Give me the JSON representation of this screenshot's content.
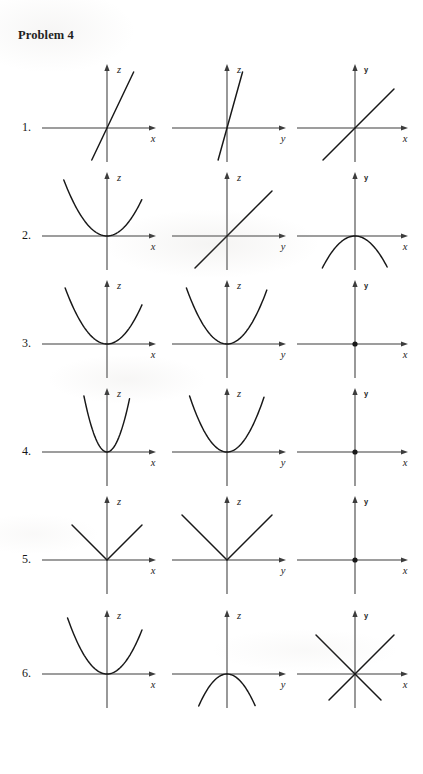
{
  "page": {
    "title": "Problem 4",
    "background_color": "#ffffff",
    "ink_color": "#181818",
    "axis_color": "#3c3c3c"
  },
  "layout": {
    "columns": [
      {
        "name": "trace-z-vs-x",
        "left": 40,
        "origin_x": 67,
        "width": 128
      },
      {
        "name": "trace-z-vs-y",
        "left": 170,
        "origin_x": 57,
        "width": 128
      },
      {
        "name": "trace-y-vs-x",
        "left": 295,
        "origin_x": 60,
        "width": 125
      }
    ],
    "row_tops": [
      10,
      118,
      226,
      334,
      442,
      556
    ],
    "axis_y_in_row": 70
  },
  "rows": [
    {
      "label": "1.",
      "cells": [
        {
          "name": "row1-col1",
          "shape": "line",
          "slope": 2.1,
          "hlabel": "x",
          "vlabel": "z",
          "vlabel_style": "serif-italic"
        },
        {
          "name": "row1-col2",
          "shape": "line",
          "slope": 3.6,
          "hlabel": "y",
          "vlabel": "z",
          "vlabel_style": "serif-italic"
        },
        {
          "name": "row1-col3",
          "shape": "line",
          "slope": 1.0,
          "hlabel": "x",
          "vlabel": "y",
          "vlabel_style": "sans-bold"
        }
      ]
    },
    {
      "label": "2.",
      "cells": [
        {
          "name": "row2-col1",
          "shape": "parabola-up",
          "a": 0.03,
          "hlabel": "x",
          "vlabel": "z",
          "vlabel_style": "serif-italic"
        },
        {
          "name": "row2-col2",
          "shape": "line",
          "slope": 1.0,
          "hlabel": "y",
          "vlabel": "z",
          "vlabel_style": "serif-italic"
        },
        {
          "name": "row2-col3",
          "shape": "parabola-down",
          "a": 0.03,
          "hlabel": "x",
          "vlabel": "y",
          "vlabel_style": "sans-bold"
        }
      ]
    },
    {
      "label": "3.",
      "cells": [
        {
          "name": "row3-col1",
          "shape": "parabola-up",
          "a": 0.032,
          "hlabel": "x",
          "vlabel": "z",
          "vlabel_style": "serif-italic"
        },
        {
          "name": "row3-col2",
          "shape": "parabola-up",
          "a": 0.034,
          "hlabel": "y",
          "vlabel": "z",
          "vlabel_style": "serif-italic"
        },
        {
          "name": "row3-col3",
          "shape": "point",
          "hlabel": "x",
          "vlabel": "y",
          "vlabel_style": "sans-bold"
        }
      ]
    },
    {
      "label": "4.",
      "cells": [
        {
          "name": "row4-col1",
          "shape": "parabola-up",
          "a": 0.105,
          "hlabel": "x",
          "vlabel": "z",
          "vlabel_style": "serif-italic"
        },
        {
          "name": "row4-col2",
          "shape": "parabola-up",
          "a": 0.04,
          "hlabel": "y",
          "vlabel": "z",
          "vlabel_style": "serif-italic"
        },
        {
          "name": "row4-col3",
          "shape": "point",
          "hlabel": "x",
          "vlabel": "y",
          "vlabel_style": "sans-bold"
        }
      ]
    },
    {
      "label": "5.",
      "cells": [
        {
          "name": "row5-col1",
          "shape": "vee",
          "slope": 1.0,
          "hlabel": "x",
          "vlabel": "z",
          "vlabel_style": "serif-italic"
        },
        {
          "name": "row5-col2",
          "shape": "vee",
          "slope": 1.0,
          "hlabel": "y",
          "vlabel": "z",
          "vlabel_style": "serif-italic"
        },
        {
          "name": "row5-col3",
          "shape": "point",
          "hlabel": "x",
          "vlabel": "y",
          "vlabel_style": "sans-bold"
        }
      ]
    },
    {
      "label": "6.",
      "cells": [
        {
          "name": "row6-col1",
          "shape": "parabola-up",
          "a": 0.036,
          "hlabel": "x",
          "vlabel": "z",
          "vlabel_style": "serif-italic"
        },
        {
          "name": "row6-col2",
          "shape": "parabola-down",
          "a": 0.04,
          "hlabel": "y",
          "vlabel": "z",
          "vlabel_style": "serif-italic"
        },
        {
          "name": "row6-col3",
          "shape": "cross",
          "slope": 1.0,
          "hlabel": "x",
          "vlabel": "y",
          "vlabel_style": "sans-bold"
        }
      ]
    }
  ]
}
